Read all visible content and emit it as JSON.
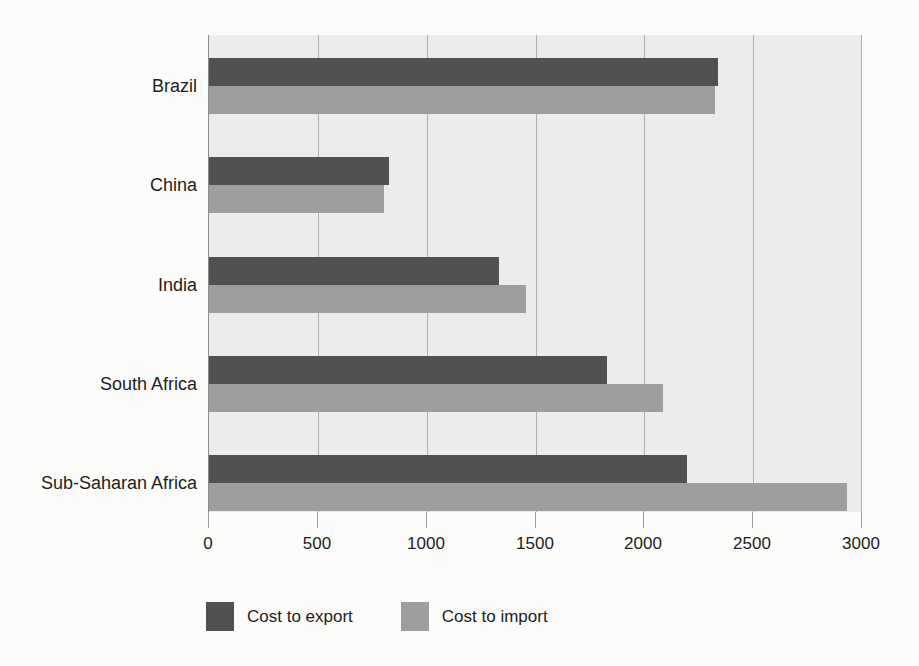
{
  "chart_data": {
    "type": "bar",
    "orientation": "horizontal",
    "categories": [
      "Brazil",
      "China",
      "India",
      "South Africa",
      "Sub-Saharan Africa"
    ],
    "series": [
      {
        "name": "Cost to export",
        "color": "#515154",
        "values": [
          2340,
          830,
          1335,
          1830,
          2200
        ]
      },
      {
        "name": "Cost to import",
        "color": "#9d9f9e",
        "values": [
          2330,
          805,
          1460,
          2090,
          2935
        ]
      }
    ],
    "title": "",
    "xlabel": "",
    "ylabel": "",
    "x_ticks": [
      0,
      500,
      1000,
      1500,
      2000,
      2500,
      3000
    ],
    "x_tick_labels": [
      "0",
      "500",
      "1000",
      "1500",
      "2000",
      "2500",
      "3000"
    ],
    "xlim": [
      0,
      3000
    ],
    "grid": "vertical",
    "legend_position": "bottom",
    "colors": {
      "plot_background": "#ececea",
      "gridline": "#b0b0ae",
      "axis_line": "#8c8c8a",
      "text": "#1d1d1b",
      "page_background": "#fcfcfa"
    }
  }
}
